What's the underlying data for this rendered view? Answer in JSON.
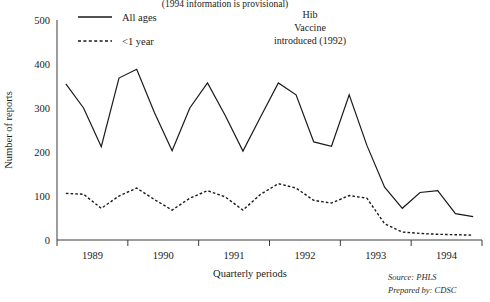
{
  "chart_data": {
    "type": "line",
    "title": "",
    "top_note": "(1994 information is provisional)",
    "xlabel": "Quarterly periods",
    "ylabel": "Number of reports",
    "ylim": [
      0,
      500
    ],
    "yticks": [
      0,
      100,
      200,
      300,
      400,
      500
    ],
    "grid": false,
    "legend_position": "top-left",
    "x_tick_labels": [
      "1989",
      "1990",
      "1991",
      "1992",
      "1993",
      "1994"
    ],
    "x": [
      1,
      2,
      3,
      4,
      5,
      6,
      7,
      8,
      9,
      10,
      11,
      12,
      13,
      14,
      15,
      16,
      17,
      18,
      19,
      20,
      21,
      22,
      23,
      24
    ],
    "series": [
      {
        "name": "All ages",
        "style": "solid",
        "values": [
          355,
          300,
          212,
          368,
          388,
          290,
          203,
          300,
          357,
          283,
          202,
          280,
          357,
          330,
          223,
          213,
          330,
          215,
          120,
          72,
          108,
          112,
          60,
          53
        ]
      },
      {
        "name": "<1 year",
        "style": "dashed",
        "values": [
          106,
          104,
          72,
          100,
          118,
          92,
          68,
          95,
          112,
          98,
          68,
          104,
          128,
          118,
          90,
          84,
          101,
          95,
          37,
          18,
          15,
          13,
          12,
          11
        ]
      }
    ],
    "annotations": [
      {
        "id": "hib-vaccine",
        "lines": [
          "Hib",
          "Vaccine",
          "introduced (1992)"
        ]
      }
    ],
    "credits": [
      "Source: PHLS",
      "Prepared by: CDSC"
    ]
  },
  "legend": {
    "items": [
      {
        "label": "All ages",
        "style": "solid"
      },
      {
        "label": "<1 year",
        "style": "dashed"
      }
    ]
  }
}
